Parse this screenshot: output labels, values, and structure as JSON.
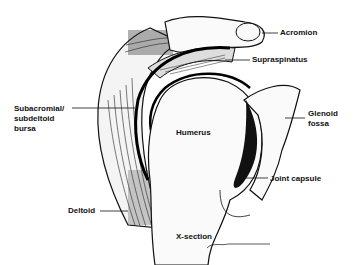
{
  "diagram": {
    "title": "X-section",
    "labels": {
      "acromion": "Acromion",
      "supraspinatus": "Supraspinatus",
      "bursa_line1": "Subacromial/",
      "bursa_line2": "subdeltoid",
      "bursa_line3": "bursa",
      "glenoid_line1": "Glenoid",
      "glenoid_line2": "fossa",
      "humerus": "Humerus",
      "joint_capsule": "Joint capsule",
      "deltoid": "Deltoid"
    },
    "caption": "X-section",
    "signature": "signature"
  }
}
